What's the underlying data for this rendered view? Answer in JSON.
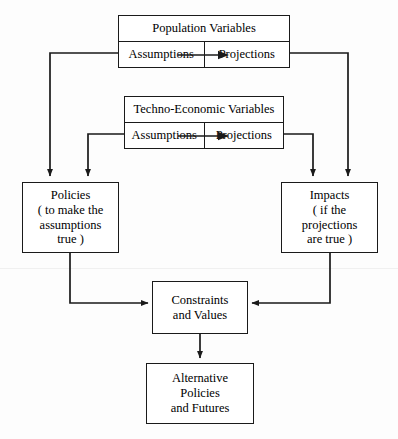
{
  "diagram": {
    "title_visible": false,
    "colors": {
      "background": "#fdfdfd",
      "node_fill": "#ffffff",
      "stroke": "#1a1a1a",
      "text": "#000000"
    },
    "groups": [
      {
        "id": "population-variables",
        "title": "Population  Variables",
        "left_cell": "Assumptions",
        "right_cell": "Projections"
      },
      {
        "id": "techno-economic-variables",
        "title": "Techno-Economic  Variables",
        "left_cell": "Assumptions",
        "right_cell": "Projections"
      }
    ],
    "nodes": [
      {
        "id": "policies",
        "lines": [
          "Policies",
          "( to make the",
          "assumptions",
          "true )"
        ]
      },
      {
        "id": "impacts",
        "lines": [
          "Impacts",
          "( if the",
          "projections",
          "are true )"
        ]
      },
      {
        "id": "constraints-and-values",
        "lines": [
          "Constraints",
          "and Values"
        ]
      },
      {
        "id": "alternative-policies-and-futures",
        "lines": [
          "Alternative",
          "Policies",
          "and Futures"
        ]
      }
    ],
    "connections": [
      {
        "from": "population-variables.assumptions",
        "to": "policies"
      },
      {
        "from": "techno-economic-variables.assumptions",
        "to": "policies"
      },
      {
        "from": "techno-economic-variables.projections",
        "to": "impacts"
      },
      {
        "from": "population-variables.projections",
        "to": "impacts"
      },
      {
        "from": "population-variables.assumptions",
        "to": "population-variables.projections"
      },
      {
        "from": "techno-economic-variables.assumptions",
        "to": "techno-economic-variables.projections"
      },
      {
        "from": "policies",
        "to": "constraints-and-values"
      },
      {
        "from": "impacts",
        "to": "constraints-and-values"
      },
      {
        "from": "constraints-and-values",
        "to": "alternative-policies-and-futures"
      }
    ]
  }
}
